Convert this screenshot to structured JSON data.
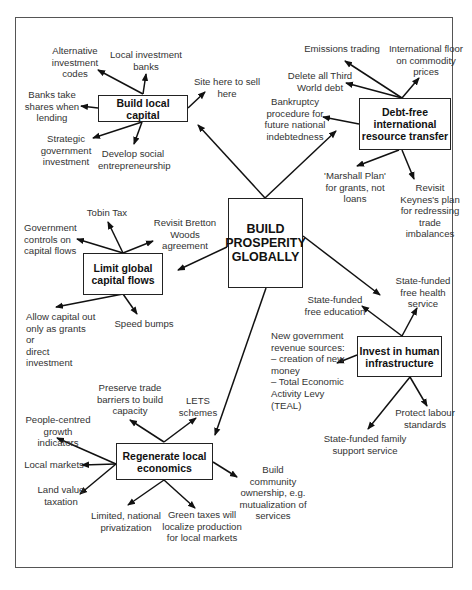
{
  "central": {
    "label": "BUILD\nPROSPERITY\nGLOBALLY"
  },
  "nodes": {
    "local_capital": {
      "label": "Build local capital",
      "items": [
        "Alternative\ninvestment\ncodes",
        "Local investment\nbanks",
        "Site here to sell\nhere",
        "Banks take\nshares when\nlending",
        "Strategic\ngovernment\ninvestment",
        "Develop social\nentrepreneurship"
      ]
    },
    "debt_free": {
      "label": "Debt-free\ninternational\nresource transfer",
      "items": [
        "Emissions trading",
        "International floor\non commodity\nprices",
        "Delete all Third\nWorld debt",
        "Bankruptcy\nprocedure for\nfuture national\nindebtedness",
        "'Marshall Plan'\nfor grants, not\nloans",
        "Revisit\nKeynes's plan\nfor redressing\ntrade\nimbalances"
      ]
    },
    "capital_flows": {
      "label": "Limit global\ncapital flows",
      "items": [
        "Tobin Tax",
        "Government\ncontrols on\ncapital flows",
        "Revisit Bretton\nWoods agreement",
        "Allow capital out\nonly as grants or\ndirect investment",
        "Speed bumps"
      ]
    },
    "human_infra": {
      "label": "Invest in human\ninfrastructure",
      "items": [
        "State-funded\nfree health\nservice",
        "State-funded\nfree education",
        "New government\nrevenue sources:\n– creation of new\n   money\n– Total Economic\n   Activity Levy\n   (TEAL)",
        "Protect labour\nstandards",
        "State-funded family\nsupport service"
      ]
    },
    "local_econ": {
      "label": "Regenerate local\neconomics",
      "items": [
        "Preserve trade\nbarriers to build\ncapacity",
        "LETS\nschemes",
        "People-centred\ngrowth indicators",
        "Local markets",
        "Land value\ntaxation",
        "Limited, national\nprivatization",
        "Green taxes will\nlocalize production\nfor local markets",
        "Build community\nownership, e.g.\nmutualization of\nservices"
      ]
    }
  }
}
